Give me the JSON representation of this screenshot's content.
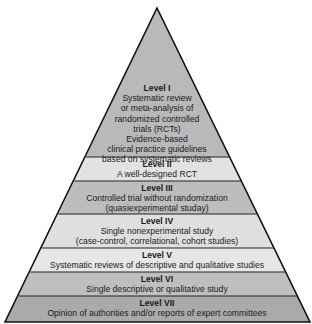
{
  "diagram": {
    "type": "evidence-hierarchy-pyramid",
    "levels": [
      {
        "title": "Level I",
        "lines": [
          "Systematic review",
          "or meta-analysis of",
          "randomized controlled",
          "trials (RCTs)",
          "Evidence-based",
          "clinical practice guidelines",
          "based on systematic reviews"
        ],
        "fill": "#b9b9b9"
      },
      {
        "title": "Level II",
        "lines": [
          "A well-designed RCT"
        ],
        "fill": "#e2e2e2"
      },
      {
        "title": "Level III",
        "lines": [
          "Controlled trial without randomization",
          "(quasiexperimental studay)"
        ],
        "fill": "#bdbdbd"
      },
      {
        "title": "Level IV",
        "lines": [
          "Single nonexperimental study",
          "(case-control, correlational, cohort studies)"
        ],
        "fill": "#dfdfdf"
      },
      {
        "title": "Level V",
        "lines": [
          "Systematic reviews of descriptive and qualitative studies"
        ],
        "fill": "#e6e6e6"
      },
      {
        "title": "Level VI",
        "lines": [
          "Single descriptive or qualitative study"
        ],
        "fill": "#bfbfbf"
      },
      {
        "title": "Level VII",
        "lines": [
          "Opinion of authorities and/or reports of expert committees"
        ],
        "fill": "#aaaaaa"
      }
    ]
  }
}
